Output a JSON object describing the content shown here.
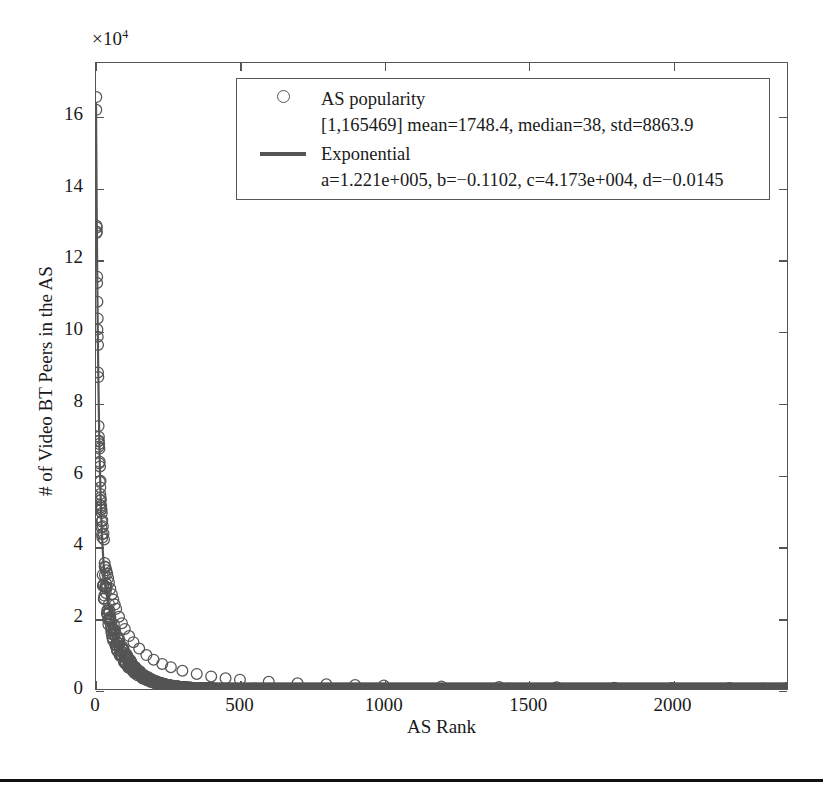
{
  "figure": {
    "y_multiplier": "×10",
    "y_multiplier_exp": "4",
    "x_axis_label": "AS Rank",
    "y_axis_label": "# of Video BT Peers in the AS"
  },
  "legend": {
    "series1_key": "circle-marker",
    "series1_label": "AS popularity",
    "series1_stats": "[1,165469] mean=1748.4, median=38, std=8863.9",
    "series2_key": "line-marker",
    "series2_label": "Exponential",
    "series2_params": "a=1.221e+005, b=−0.1102, c=4.173e+004, d=−0.0145"
  },
  "axes": {
    "x_ticks": [
      "0",
      "500",
      "1000",
      "1500",
      "2000"
    ],
    "y_ticks": [
      "0",
      "2",
      "4",
      "6",
      "8",
      "10",
      "12",
      "14",
      "16"
    ]
  },
  "colors": {
    "axis": "#555555",
    "marker": "#555555",
    "curve": "#555555",
    "background": "#ffffff"
  },
  "chart_data": {
    "type": "scatter",
    "title": "",
    "xlabel": "AS Rank",
    "ylabel": "# of Video BT Peers in the AS",
    "y_multiplier": 10000,
    "xlim": [
      0,
      2400
    ],
    "ylim": [
      0,
      17.5
    ],
    "xticks": [
      0,
      500,
      1000,
      1500,
      2000
    ],
    "yticks": [
      0,
      2,
      4,
      6,
      8,
      10,
      12,
      14,
      16
    ],
    "grid": false,
    "legend_position": "upper-center",
    "series": [
      {
        "name": "AS popularity",
        "marker": "o",
        "stats": {
          "range": [
            1,
            165469
          ],
          "mean": 1748.4,
          "median": 38,
          "std": 8863.9
        },
        "note": "Rank-ordered AS popularity, n≈2400 autonomous systems; values in units of 1e4 on the y-axis",
        "x": [
          1,
          2,
          3,
          4,
          5,
          6,
          7,
          8,
          9,
          10,
          11,
          12,
          13,
          14,
          15,
          16,
          17,
          18,
          19,
          20,
          22,
          24,
          26,
          28,
          30,
          33,
          36,
          39,
          42,
          45,
          50,
          55,
          60,
          65,
          70,
          80,
          90,
          100,
          115,
          130,
          150,
          175,
          200,
          230,
          260,
          300,
          350,
          400,
          450,
          500,
          600,
          700,
          800,
          900,
          1000,
          1200,
          1400,
          1600,
          1800,
          2000,
          2200,
          2400
        ],
        "y": [
          16.5469,
          12.95,
          12.78,
          11.35,
          10.05,
          9.85,
          9.62,
          8.72,
          7.35,
          7.05,
          6.85,
          6.72,
          6.35,
          6.22,
          5.45,
          5.35,
          5.28,
          5.12,
          5.02,
          4.92,
          4.72,
          4.55,
          4.35,
          4.18,
          3.52,
          3.4,
          3.32,
          3.22,
          3.1,
          2.98,
          2.8,
          2.65,
          2.5,
          2.36,
          2.24,
          2.02,
          1.84,
          1.68,
          1.48,
          1.31,
          1.13,
          0.95,
          0.82,
          0.7,
          0.61,
          0.51,
          0.42,
          0.35,
          0.3,
          0.26,
          0.2,
          0.16,
          0.13,
          0.11,
          0.095,
          0.072,
          0.057,
          0.046,
          0.038,
          0.031,
          0.026,
          0.022
        ]
      },
      {
        "name": "Exponential",
        "type": "line",
        "equation": "y = a*exp(b*x) + c*exp(d*x)",
        "params": {
          "a": 122100,
          "b": -0.1102,
          "c": 41730,
          "d": -0.0145
        }
      }
    ]
  }
}
